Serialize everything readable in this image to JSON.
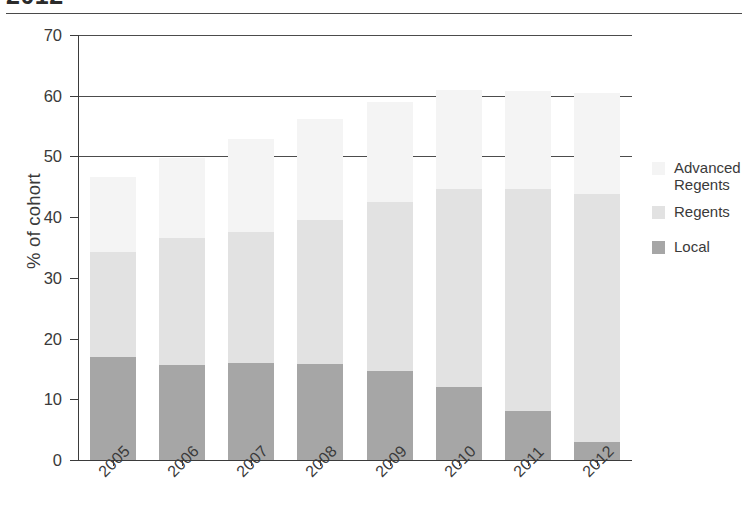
{
  "page": {
    "clipped_title": "2012"
  },
  "chart_data": {
    "type": "bar",
    "subtype": "stacked-vertical",
    "title": "",
    "xlabel": "",
    "ylabel": "% of cohort",
    "ylim": [
      0,
      70
    ],
    "yticks": [
      0,
      10,
      20,
      30,
      40,
      50,
      60,
      70
    ],
    "ytick_labels": [
      "0",
      "10",
      "20",
      "30",
      "40",
      "50",
      "60",
      "70"
    ],
    "gridlines_at": [
      50,
      60,
      70
    ],
    "grid": "partial-horizontal",
    "legend_position": "right",
    "categories": [
      "2005",
      "2006",
      "2007",
      "2008",
      "2009",
      "2010",
      "2011",
      "2012"
    ],
    "series": [
      {
        "name": "Local",
        "color": "#a6a6a6",
        "values": [
          17.0,
          15.7,
          16.0,
          15.8,
          14.6,
          12.0,
          8.1,
          2.9
        ]
      },
      {
        "name": "Regents",
        "color": "#e2e2e2",
        "values": [
          17.3,
          20.9,
          21.6,
          23.7,
          27.9,
          32.6,
          36.5,
          40.9
        ]
      },
      {
        "name": "Advanced Regents",
        "color": "#f4f4f4",
        "values": [
          12.3,
          13.1,
          15.3,
          16.7,
          16.5,
          16.4,
          16.1,
          16.6
        ]
      }
    ],
    "cumulative_tops": {
      "local": [
        17.0,
        15.7,
        16.0,
        15.8,
        14.6,
        12.0,
        8.1,
        2.9
      ],
      "regents": [
        34.3,
        36.6,
        37.6,
        39.5,
        42.5,
        44.6,
        44.6,
        43.8
      ],
      "total": [
        46.6,
        49.7,
        52.9,
        56.2,
        59.0,
        61.0,
        60.7,
        60.4
      ]
    }
  },
  "legend": {
    "items": [
      {
        "label": "Advanced\nRegents",
        "label_line1": "Advanced",
        "label_line2": "Regents",
        "color": "#f4f4f4"
      },
      {
        "label": "Regents",
        "label_line1": "Regents",
        "label_line2": "",
        "color": "#e2e2e2"
      },
      {
        "label": "Local",
        "label_line1": "Local",
        "label_line2": "",
        "color": "#a6a6a6"
      }
    ]
  }
}
